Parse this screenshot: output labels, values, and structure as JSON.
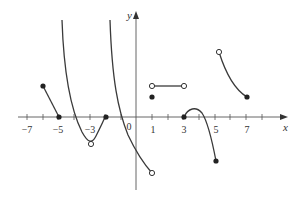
{
  "figure": {
    "x_axis_label": "x",
    "y_axis_label": "y",
    "origin_label": "0",
    "tick_labels": [
      {
        "text": "−7",
        "x": 27
      },
      {
        "text": "−5",
        "x": 58
      },
      {
        "text": "−3",
        "x": 90
      },
      {
        "text": "1",
        "x": 153
      },
      {
        "text": "3",
        "x": 184
      },
      {
        "text": "5",
        "x": 216
      },
      {
        "text": "7",
        "x": 247
      }
    ],
    "curve_color": "#3a3a3a",
    "axis_color": "#555555"
  }
}
